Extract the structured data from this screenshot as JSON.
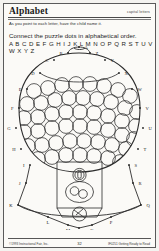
{
  "page": {
    "title": "Alphabet",
    "corner_label": "capital letters",
    "instruction_small": "As you point to each letter, have the child name it.",
    "instruction_main": "Connect the puzzle dots in alphabetical order.",
    "alphabet_row": "A B C D E F G H I J K L M N O P Q R S T U V W X Y Z",
    "ink_color": "#1e1e1e",
    "paper_color": "#fbfaf7"
  },
  "puzzle": {
    "subject": "gumball-machine",
    "dot_letters": [
      "A",
      "B",
      "C",
      "D",
      "E",
      "F",
      "G",
      "H",
      "I",
      "J",
      "K",
      "L",
      "M",
      "N",
      "O",
      "P",
      "Q",
      "R",
      "S",
      "T",
      "U",
      "V",
      "W",
      "X",
      "Y",
      "Z"
    ],
    "dots": [
      {
        "letter": "A",
        "x": 79,
        "y": 3
      },
      {
        "letter": "B",
        "x": 68,
        "y": 9
      },
      {
        "letter": "Z",
        "x": 90,
        "y": 9
      },
      {
        "letter": "C",
        "x": 54,
        "y": 16
      },
      {
        "letter": "Y",
        "x": 105,
        "y": 16
      },
      {
        "letter": "D",
        "x": 40,
        "y": 29
      },
      {
        "letter": "X",
        "x": 119,
        "y": 29
      },
      {
        "letter": "E",
        "x": 27,
        "y": 45
      },
      {
        "letter": "W",
        "x": 132,
        "y": 45
      },
      {
        "letter": "F",
        "x": 19,
        "y": 64
      },
      {
        "letter": "V",
        "x": 140,
        "y": 64
      },
      {
        "letter": "G",
        "x": 16,
        "y": 84
      },
      {
        "letter": "U",
        "x": 143,
        "y": 84
      },
      {
        "letter": "H",
        "x": 21,
        "y": 105
      },
      {
        "letter": "T",
        "x": 138,
        "y": 105
      },
      {
        "letter": "I",
        "x": 30,
        "y": 121
      },
      {
        "letter": "S",
        "x": 129,
        "y": 121
      },
      {
        "letter": "J",
        "x": 26,
        "y": 139
      },
      {
        "letter": "R",
        "x": 133,
        "y": 139
      },
      {
        "letter": "K",
        "x": 18,
        "y": 161
      },
      {
        "letter": "Q",
        "x": 141,
        "y": 161
      },
      {
        "letter": "L",
        "x": 48,
        "y": 173
      },
      {
        "letter": "P",
        "x": 111,
        "y": 173
      },
      {
        "letter": "M",
        "x": 68,
        "y": 181
      },
      {
        "letter": "N",
        "x": 79,
        "y": 184
      },
      {
        "letter": "O",
        "x": 92,
        "y": 181
      }
    ]
  },
  "footer": {
    "left": "©1993 Instructional Fair, Inc.",
    "page_number": "32",
    "right": "IF0251 Getting Ready to Read"
  }
}
